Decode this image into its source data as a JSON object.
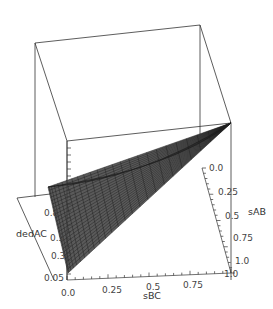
{
  "chart_data": {
    "type": "surface3d",
    "title": "",
    "axes": {
      "x": {
        "label": "sBC",
        "range": [
          0.0,
          1.0
        ],
        "ticks": [
          "0.0",
          "0.25",
          "0.5",
          "0.75",
          "1.0"
        ]
      },
      "y": {
        "label": "sAB",
        "range": [
          0.0,
          1.0
        ],
        "ticks": [
          "0.0",
          "0.25",
          "0.5",
          "0.75",
          "1.0"
        ]
      },
      "z": {
        "label": "dedAC",
        "range": [
          0.05,
          0.8
        ],
        "ticks": [
          "0.05",
          "0.3",
          "0.5",
          "0.8"
        ]
      }
    },
    "surface": {
      "description": "Wire-mesh surface; dedAC highest (~0.8) near sBC=0,sAB=0 edge and decreasing to ~0.05 toward sBC=0,sAB=1; converges at sBC=1 corner",
      "fill_color": "#555555",
      "mesh_color": "#1a1a1a",
      "grid_lines": 25
    },
    "box": {
      "visible": true,
      "color": "#333333"
    },
    "grid": false,
    "legend": null
  }
}
